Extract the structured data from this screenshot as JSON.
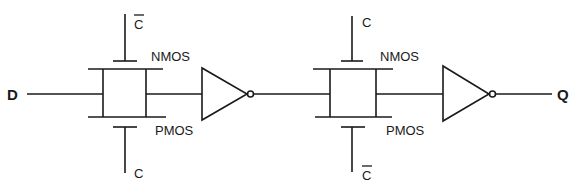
{
  "diagram": {
    "type": "circuit-schematic",
    "input_label": "D",
    "output_label": "Q",
    "stages": [
      {
        "transmission_gate": {
          "nmos_label": "NMOS",
          "pmos_label": "PMOS",
          "nmos_gate_signal": "C",
          "nmos_gate_inverted": true,
          "pmos_gate_signal": "C",
          "pmos_gate_inverted": false
        },
        "inverter": true
      },
      {
        "transmission_gate": {
          "nmos_label": "NMOS",
          "pmos_label": "PMOS",
          "nmos_gate_signal": "C",
          "nmos_gate_inverted": false,
          "pmos_gate_signal": "C",
          "pmos_gate_inverted": true
        },
        "inverter": true
      }
    ],
    "colors": {
      "line": "#1a1a1a",
      "background": "#ffffff"
    }
  }
}
